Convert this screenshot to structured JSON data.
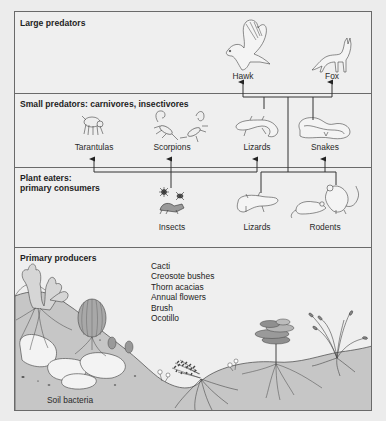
{
  "diagram": {
    "type": "desert food web",
    "levels": [
      {
        "id": "large-predators",
        "title": "Large predators",
        "organisms": [
          "Hawk",
          "Fox"
        ]
      },
      {
        "id": "small-predators",
        "title": "Small predators: carnivores, insectivores",
        "organisms": [
          "Tarantulas",
          "Scorpions",
          "Lizards",
          "Snakes"
        ]
      },
      {
        "id": "plant-eaters",
        "title_line1": "Plant eaters:",
        "title_line2": "primary consumers",
        "organisms": [
          "Insects",
          "Lizards",
          "Rodents"
        ]
      },
      {
        "id": "primary-producers",
        "title": "Primary producers",
        "producers_list": [
          "Cacti",
          "Creosote bushes",
          "Thorn acacias",
          "Annual flowers",
          "Brush",
          "Ocotillo"
        ],
        "soil_label": "Soil bacteria"
      }
    ],
    "links": [
      {
        "from": "Lizards (small predators)",
        "to": "Hawk"
      },
      {
        "from": "Lizards (small predators)",
        "to": "Fox"
      },
      {
        "from": "Snakes",
        "to": "Hawk"
      },
      {
        "from": "Snakes",
        "to": "Fox"
      },
      {
        "from": "Lizards (plant eaters)",
        "to": "Hawk"
      },
      {
        "from": "Rodents",
        "to": "Fox"
      },
      {
        "from": "Rodents",
        "to": "Snakes"
      },
      {
        "from": "Insects",
        "to": "Scorpions"
      },
      {
        "from": "Insects",
        "to": "Tarantulas"
      },
      {
        "from": "Insects",
        "to": "Lizards (small predators)"
      }
    ],
    "colors": {
      "background": "#ececec",
      "panel": "#efefef",
      "border": "#6a6a6a",
      "ground": "#c4c4c4",
      "line": "#333333"
    }
  }
}
